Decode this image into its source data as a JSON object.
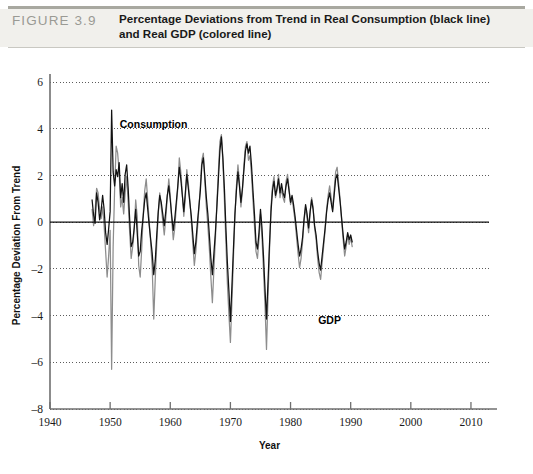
{
  "header": {
    "figure_number": "FIGURE 3.9",
    "title_line1": "Percentage Deviations from Trend in Real Consumption (black line)",
    "title_line2": "and Real GDP (colored line)"
  },
  "colors": {
    "consumption_line": "#121212",
    "gdp_line": "#8d8d8d",
    "axis": "#6f6f6f",
    "gridline": "#4a4a4a",
    "zero_line": "#111111",
    "header_band": "#f1f0ec",
    "header_rule": "#a8a8a0",
    "figure_number_text": "#9a9a94"
  },
  "annotations": [
    {
      "name": "consumption-label",
      "text": "Consumption",
      "x_year": 1951.6,
      "y_value": 4.05
    },
    {
      "name": "gdp-label",
      "text": "GDP",
      "x_year": 1984.6,
      "y_value": -4.35
    }
  ],
  "chart_data": {
    "type": "line",
    "title": "Percentage Deviations from Trend in Real Consumption (black line) and Real GDP (colored line)",
    "xlabel": "Year",
    "ylabel": "Percentage Deviation From Trend",
    "xlim": [
      1940,
      2013
    ],
    "ylim": [
      -8,
      6
    ],
    "xticks": [
      1940,
      1950,
      1960,
      1970,
      1980,
      1990,
      2000,
      2010
    ],
    "yticks": [
      -8,
      -6,
      -4,
      -2,
      0,
      2,
      4,
      6
    ],
    "grid": true,
    "grid_style": "dotted",
    "legend_position": "inline-annotations",
    "x_start": 1947.0,
    "x_step": 0.25,
    "series": [
      {
        "name": "Consumption",
        "color": "#121212",
        "values": [
          0.95,
          0.3,
          -0.05,
          1.25,
          0.85,
          0.1,
          0.5,
          1.15,
          0.55,
          -0.45,
          -0.95,
          -0.3,
          0.45,
          4.8,
          2.15,
          1.55,
          2.25,
          1.95,
          2.55,
          1.05,
          1.65,
          0.85,
          2.05,
          2.45,
          1.45,
          0.1,
          -1.05,
          -0.85,
          -0.25,
          0.55,
          -0.45,
          -1.45,
          -1.25,
          -0.35,
          0.25,
          0.95,
          1.25,
          0.55,
          -0.15,
          -0.75,
          -1.35,
          -2.25,
          -1.65,
          -0.55,
          0.45,
          1.15,
          0.85,
          0.35,
          -0.15,
          0.45,
          1.15,
          1.55,
          0.95,
          0.25,
          -0.35,
          0.15,
          0.85,
          1.55,
          2.35,
          1.85,
          1.15,
          0.45,
          1.25,
          2.05,
          1.45,
          0.85,
          0.25,
          -0.55,
          -1.35,
          -0.85,
          -0.05,
          0.65,
          1.35,
          2.45,
          2.75,
          1.95,
          1.05,
          0.35,
          -0.55,
          -1.55,
          -2.25,
          -1.35,
          -0.45,
          0.65,
          1.85,
          3.05,
          3.65,
          2.75,
          1.45,
          -0.25,
          -1.75,
          -2.95,
          -4.25,
          -2.75,
          -1.15,
          0.35,
          1.35,
          2.15,
          1.55,
          0.85,
          1.45,
          2.25,
          3.05,
          3.35,
          2.95,
          3.25,
          2.45,
          1.35,
          0.35,
          -0.85,
          -1.15,
          -0.45,
          0.55,
          -0.25,
          -1.45,
          -2.85,
          -4.15,
          -2.55,
          -0.95,
          0.45,
          1.35,
          1.75,
          1.15,
          1.45,
          1.85,
          1.25,
          1.65,
          1.25,
          1.05,
          1.55,
          1.85,
          1.35,
          0.85,
          1.15,
          0.75,
          0.25,
          -0.35,
          -0.95,
          -1.45,
          -1.15,
          -0.65,
          0.15,
          0.75,
          0.35,
          -0.25,
          0.45,
          0.95,
          0.55,
          -0.15,
          -0.55,
          -1.25,
          -1.75,
          -2.05,
          -1.45,
          -0.85,
          -0.25,
          0.45,
          0.95,
          1.25,
          0.85,
          0.45,
          1.15,
          1.85,
          2.05,
          1.45,
          0.85,
          0.15,
          -0.55,
          -1.15,
          -0.85,
          -0.45,
          -0.75,
          -0.55,
          -0.85
        ]
      },
      {
        "name": "GDP",
        "color": "#8d8d8d",
        "values": [
          0.55,
          -0.15,
          0.45,
          1.45,
          1.25,
          0.55,
          0.15,
          0.65,
          -0.15,
          -1.25,
          -2.35,
          -1.45,
          -0.35,
          -6.3,
          -1.05,
          1.45,
          3.25,
          2.95,
          2.15,
          0.65,
          1.05,
          0.35,
          1.25,
          1.95,
          0.85,
          -0.45,
          -1.55,
          -1.05,
          -0.35,
          0.95,
          0.25,
          -1.85,
          -2.35,
          -1.15,
          0.35,
          1.35,
          1.85,
          0.95,
          0.05,
          -0.95,
          -1.95,
          -4.15,
          -2.45,
          -0.95,
          0.35,
          1.25,
          0.65,
          0.05,
          -0.55,
          0.15,
          1.05,
          1.85,
          1.15,
          0.05,
          -0.75,
          -0.25,
          0.65,
          1.45,
          2.75,
          2.15,
          1.25,
          0.25,
          1.05,
          2.25,
          1.65,
          0.95,
          0.05,
          -0.95,
          -1.85,
          -1.25,
          -0.35,
          0.55,
          1.55,
          2.65,
          2.95,
          1.75,
          0.65,
          -0.15,
          -1.15,
          -2.35,
          -3.45,
          -2.05,
          -0.75,
          0.85,
          2.15,
          3.45,
          3.75,
          2.55,
          0.95,
          -0.85,
          -2.65,
          -3.95,
          -5.15,
          -3.45,
          -1.55,
          0.25,
          1.55,
          2.45,
          1.75,
          0.65,
          1.35,
          2.45,
          3.25,
          3.45,
          2.65,
          2.85,
          2.05,
          0.95,
          -0.15,
          -1.25,
          -1.55,
          -0.75,
          0.35,
          -0.65,
          -2.05,
          -3.55,
          -5.45,
          -3.25,
          -1.25,
          0.65,
          1.55,
          1.95,
          1.05,
          1.35,
          2.05,
          1.05,
          1.45,
          1.05,
          0.85,
          1.75,
          2.05,
          1.45,
          0.75,
          1.05,
          0.55,
          0.05,
          -0.65,
          -1.35,
          -1.95,
          -1.55,
          -0.85,
          0.05,
          0.65,
          0.15,
          -0.45,
          0.35,
          1.05,
          0.65,
          -0.25,
          -0.75,
          -1.55,
          -2.15,
          -2.45,
          -1.75,
          -1.05,
          -0.35,
          0.55,
          1.15,
          1.55,
          1.05,
          0.55,
          1.35,
          2.15,
          2.35,
          1.65,
          0.95,
          0.05,
          -0.75,
          -1.45,
          -1.05,
          -0.55,
          -0.95,
          -0.65,
          -1.05
        ]
      }
    ]
  }
}
